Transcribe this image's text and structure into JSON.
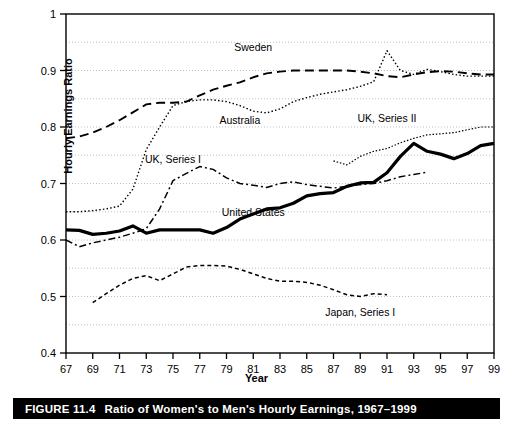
{
  "figure": {
    "caption_number": "FIGURE 11.4",
    "caption_title": "Ratio of Women's to Men's Hourly Earnings, 1967–1999"
  },
  "axes": {
    "ylabel": "Hourly Earnings Ratio",
    "xlabel": "Year",
    "y_ticks": [
      "1",
      "0.9",
      "0.8",
      "0.7",
      "0.6",
      "0.5",
      "0.4"
    ],
    "x_ticks": [
      "67",
      "69",
      "71",
      "73",
      "75",
      "77",
      "79",
      "81",
      "83",
      "85",
      "87",
      "89",
      "91",
      "93",
      "95",
      "97",
      "99"
    ]
  },
  "chart_data": {
    "type": "line",
    "title": "Ratio of Women's to Men's Hourly Earnings, 1967–1999",
    "xlabel": "Year",
    "ylabel": "Hourly Earnings Ratio",
    "xlim": [
      1967,
      1999
    ],
    "ylim": [
      0.4,
      1.0
    ],
    "y_major_ticks": [
      0.4,
      0.5,
      0.6,
      0.7,
      0.8,
      0.9,
      1.0
    ],
    "y_gridlines": [
      0.45,
      0.55,
      0.65,
      0.75,
      0.85,
      0.95
    ],
    "x_tick_years": [
      1967,
      1969,
      1971,
      1973,
      1975,
      1977,
      1979,
      1981,
      1983,
      1985,
      1987,
      1989,
      1991,
      1993,
      1995,
      1997,
      1999
    ],
    "grid": "horizontal-dotted",
    "legend": "inline-annotations",
    "series": [
      {
        "name": "Sweden",
        "style": "dashed",
        "label_x": 1981,
        "label_y": 0.935,
        "x": [
          1967,
          1968,
          1969,
          1970,
          1971,
          1972,
          1973,
          1974,
          1975,
          1976,
          1977,
          1978,
          1979,
          1980,
          1981,
          1982,
          1983,
          1984,
          1985,
          1986,
          1987,
          1988,
          1989,
          1990,
          1991,
          1992,
          1993,
          1994,
          1995,
          1996,
          1997,
          1998,
          1999
        ],
        "y": [
          0.78,
          0.783,
          0.79,
          0.8,
          0.812,
          0.826,
          0.84,
          0.843,
          0.843,
          0.845,
          0.856,
          0.866,
          0.873,
          0.879,
          0.888,
          0.895,
          0.898,
          0.9,
          0.9,
          0.9,
          0.9,
          0.9,
          0.898,
          0.895,
          0.89,
          0.888,
          0.893,
          0.897,
          0.899,
          0.898,
          0.895,
          0.893,
          0.893
        ]
      },
      {
        "name": "Australia",
        "style": "dotted",
        "label_x": 1980,
        "label_y": 0.805,
        "x": [
          1967,
          1968,
          1969,
          1970,
          1971,
          1972,
          1973,
          1974,
          1975,
          1976,
          1977,
          1978,
          1979,
          1980,
          1981,
          1982,
          1983,
          1984,
          1985,
          1986,
          1987,
          1988,
          1989,
          1990,
          1991,
          1992,
          1993,
          1994,
          1995,
          1996,
          1997,
          1998,
          1999
        ],
        "y": [
          0.65,
          0.65,
          0.652,
          0.655,
          0.66,
          0.69,
          0.76,
          0.8,
          0.838,
          0.845,
          0.848,
          0.848,
          0.845,
          0.838,
          0.828,
          0.825,
          0.832,
          0.845,
          0.852,
          0.858,
          0.862,
          0.866,
          0.872,
          0.88,
          0.935,
          0.9,
          0.893,
          0.902,
          0.898,
          0.893,
          0.89,
          0.89,
          0.89
        ]
      },
      {
        "name": "UK, Series I",
        "style": "dash-dot",
        "label_x": 1975,
        "label_y": 0.737,
        "x": [
          1967,
          1968,
          1969,
          1970,
          1971,
          1972,
          1973,
          1974,
          1975,
          1976,
          1977,
          1978,
          1979,
          1980,
          1981,
          1982,
          1983,
          1984,
          1985,
          1986,
          1987,
          1988,
          1989,
          1990,
          1991,
          1992,
          1993,
          1994
        ],
        "y": [
          0.6,
          0.588,
          0.595,
          0.6,
          0.605,
          0.612,
          0.62,
          0.655,
          0.705,
          0.718,
          0.73,
          0.725,
          0.71,
          0.7,
          0.697,
          0.693,
          0.7,
          0.703,
          0.698,
          0.695,
          0.692,
          0.695,
          0.698,
          0.7,
          0.705,
          0.712,
          0.716,
          0.72
        ]
      },
      {
        "name": "UK, Series II",
        "style": "dotted-thin",
        "label_x": 1991,
        "label_y": 0.808,
        "x": [
          1987,
          1988,
          1989,
          1990,
          1991,
          1992,
          1993,
          1994,
          1995,
          1996,
          1997,
          1998,
          1999
        ],
        "y": [
          0.74,
          0.733,
          0.748,
          0.757,
          0.762,
          0.772,
          0.78,
          0.786,
          0.788,
          0.79,
          0.795,
          0.8,
          0.8
        ]
      },
      {
        "name": "United States",
        "style": "solid-thick",
        "label_x": 1981,
        "label_y": 0.643,
        "x": [
          1967,
          1968,
          1969,
          1970,
          1971,
          1972,
          1973,
          1974,
          1975,
          1976,
          1977,
          1978,
          1979,
          1980,
          1981,
          1982,
          1983,
          1984,
          1985,
          1986,
          1987,
          1988,
          1989,
          1990,
          1991,
          1992,
          1993,
          1994,
          1995,
          1996,
          1997,
          1998,
          1999
        ],
        "y": [
          0.618,
          0.617,
          0.61,
          0.612,
          0.616,
          0.625,
          0.612,
          0.618,
          0.618,
          0.618,
          0.618,
          0.612,
          0.622,
          0.637,
          0.646,
          0.655,
          0.657,
          0.665,
          0.678,
          0.682,
          0.684,
          0.695,
          0.701,
          0.702,
          0.719,
          0.748,
          0.771,
          0.757,
          0.752,
          0.744,
          0.753,
          0.767,
          0.771
        ]
      },
      {
        "name": "Japan, Series I",
        "style": "dashed-short",
        "label_x": 1989,
        "label_y": 0.465,
        "x": [
          1969,
          1970,
          1971,
          1972,
          1973,
          1974,
          1975,
          1976,
          1977,
          1978,
          1979,
          1980,
          1981,
          1982,
          1983,
          1984,
          1985,
          1986,
          1987,
          1988,
          1989,
          1990,
          1991
        ],
        "y": [
          0.489,
          0.505,
          0.52,
          0.532,
          0.537,
          0.528,
          0.54,
          0.552,
          0.555,
          0.555,
          0.554,
          0.548,
          0.54,
          0.532,
          0.527,
          0.527,
          0.525,
          0.52,
          0.512,
          0.503,
          0.5,
          0.505,
          0.503
        ]
      }
    ]
  }
}
